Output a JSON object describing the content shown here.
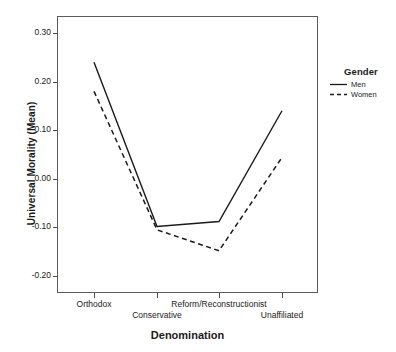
{
  "chart_data": {
    "type": "line",
    "title": "",
    "xlabel": "Denomination",
    "ylabel": "Universal Morality (Mean)",
    "categories": [
      "Orthodox",
      "Conservative",
      "Reform/Reconstructionist",
      "Unaffiliated"
    ],
    "series": [
      {
        "name": "Men",
        "style": "solid",
        "values": [
          0.24,
          -0.098,
          -0.088,
          0.14
        ]
      },
      {
        "name": "Women",
        "style": "dashed",
        "values": [
          0.18,
          -0.105,
          -0.148,
          0.044
        ]
      }
    ],
    "ylim": [
      -0.235,
      0.335
    ],
    "yticks": [
      0.3,
      0.2,
      0.1,
      0.0,
      -0.1,
      -0.2
    ],
    "ytick_labels": [
      "0.30",
      "0.20",
      "0.10",
      "0.00",
      "-0.10",
      "-0.20"
    ],
    "grid": false,
    "legend": {
      "title": "Gender",
      "position": "right",
      "entries": [
        "Men",
        "Women"
      ]
    },
    "line_color": "#1a1a1a"
  },
  "axes": {
    "y_title": "Universal Morality (Mean)",
    "x_title": "Denomination",
    "y_ticks": [
      {
        "label": "0.30",
        "value": 0.3
      },
      {
        "label": "0.20",
        "value": 0.2
      },
      {
        "label": "0.10",
        "value": 0.1
      },
      {
        "label": "0.00",
        "value": 0.0
      },
      {
        "label": "-0.10",
        "value": -0.1
      },
      {
        "label": "-0.20",
        "value": -0.2
      }
    ],
    "x_ticks": [
      {
        "label": "Orthodox",
        "row": 0
      },
      {
        "label": "Conservative",
        "row": 1
      },
      {
        "label": "Reform/Reconstructionist",
        "row": 0
      },
      {
        "label": "Unaffiliated",
        "row": 1
      }
    ]
  },
  "legend": {
    "title": "Gender",
    "items": [
      {
        "label": "Men",
        "dash": "none"
      },
      {
        "label": "Women",
        "dash": "dashed"
      }
    ]
  },
  "colors": {
    "line": "#1a1a1a",
    "frame": "#5a5a5a",
    "text": "#1a1a1a",
    "background": "#ffffff"
  }
}
